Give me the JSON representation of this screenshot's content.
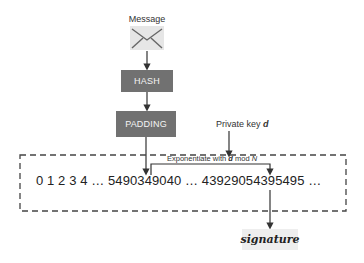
{
  "diagram": {
    "message_label": "Message",
    "envelope_icon": "envelope-icon",
    "hash_label": "HASH",
    "padding_label": "PADDING",
    "private_key": {
      "prefix": "Private key ",
      "var": "d"
    },
    "exponentiate": {
      "prefix": "Exponentiate with ",
      "var": "d",
      "middle": " mod ",
      "modulus": "N"
    },
    "number_line": "0 1 2 3 4 … 5490349040 … 43929054395495 …",
    "signature_label": "signature",
    "colors": {
      "box_fill": "#717171",
      "box_text": "#f4f4f4",
      "line": "#333333",
      "signature_bg": "#eeeeee",
      "envelope_bg": "#e6e6e6"
    }
  }
}
